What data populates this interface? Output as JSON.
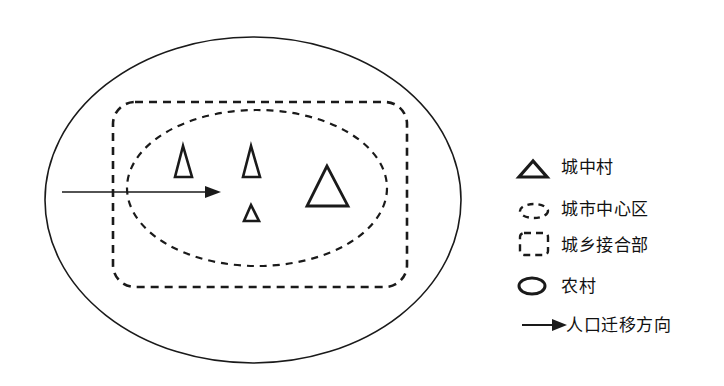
{
  "diagram": {
    "title": "",
    "regions": {
      "rural": {
        "label": "农村",
        "shape": "ellipse",
        "stroke": "solid"
      },
      "urban_rural_fringe": {
        "label": "城乡接合部",
        "shape": "rounded-rectangle",
        "stroke": "dashed"
      },
      "city_center": {
        "label": "城市中心区",
        "shape": "ellipse",
        "stroke": "dashed"
      }
    },
    "villages_in_city": {
      "label": "城中村",
      "count": 4,
      "sizes": [
        "small-tall",
        "small-tall",
        "small",
        "large"
      ]
    },
    "migration_arrow": {
      "label": "人口迁移方向",
      "direction": "rural-to-city-center"
    }
  },
  "legend": {
    "items": [
      {
        "icon": "triangle-icon",
        "label": "城中村"
      },
      {
        "icon": "dashed-ellipse-icon",
        "label": "城市中心区"
      },
      {
        "icon": "dashed-rounded-rect-icon",
        "label": "城乡接合部"
      },
      {
        "icon": "ellipse-icon",
        "label": "农村"
      },
      {
        "icon": "arrow-right-icon",
        "label": "人口迁移方向"
      }
    ]
  },
  "colors": {
    "stroke": "#1a1a1a",
    "background": "#ffffff"
  }
}
